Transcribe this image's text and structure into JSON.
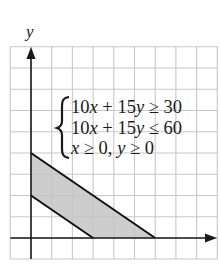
{
  "figure": {
    "axis_labels": {
      "y": "y"
    },
    "system": {
      "lines": [
        {
          "lhs_a": "10",
          "var_a": "x",
          "op": " + ",
          "lhs_b": "15",
          "var_b": "y",
          "rel": " ≥ ",
          "rhs": "30"
        },
        {
          "lhs_a": "10",
          "var_a": "x",
          "op": " + ",
          "lhs_b": "15",
          "var_b": "y",
          "rel": " ≤ ",
          "rhs": "60"
        },
        {
          "var_a": "x",
          "rel_a": " ≥ 0, ",
          "var_b": "y",
          "rel_b": " ≥ 0"
        }
      ]
    },
    "colors": {
      "grid": "#c8c8c8",
      "axis": "#1a1a1a",
      "boundary": "#111111",
      "feasible_fill": "#c4c4c4"
    },
    "grid": {
      "x_min": -1,
      "x_max": 9,
      "y_min": -1,
      "y_max": 9,
      "step": 1
    },
    "boundaries": [
      {
        "equation": "10x + 15y = 30",
        "x_intercept": 3,
        "y_intercept": 2
      },
      {
        "equation": "10x + 15y = 60",
        "x_intercept": 6,
        "y_intercept": 4
      }
    ],
    "feasible_region": [
      [
        0,
        2
      ],
      [
        0,
        4
      ],
      [
        6,
        0
      ],
      [
        3,
        0
      ]
    ]
  }
}
